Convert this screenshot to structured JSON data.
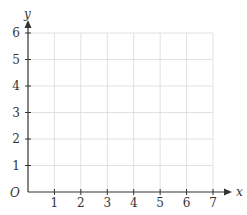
{
  "chart_data": {
    "type": "scatter",
    "title": "",
    "xlabel": "x",
    "ylabel": "y",
    "origin_label": "O",
    "xlim": [
      0,
      7
    ],
    "ylim": [
      0,
      6
    ],
    "x_ticks": [
      1,
      2,
      3,
      4,
      5,
      6,
      7
    ],
    "y_ticks": [
      1,
      2,
      3,
      4,
      5,
      6
    ],
    "x_tick_labels": [
      "1",
      "2",
      "3",
      "4",
      "5",
      "6",
      "7"
    ],
    "y_tick_labels": [
      "1",
      "2",
      "3",
      "4",
      "5",
      "6"
    ],
    "grid": true,
    "series": [],
    "legend": null
  },
  "colors": {
    "axis": "#333333",
    "grid": "#d9d9d9"
  }
}
